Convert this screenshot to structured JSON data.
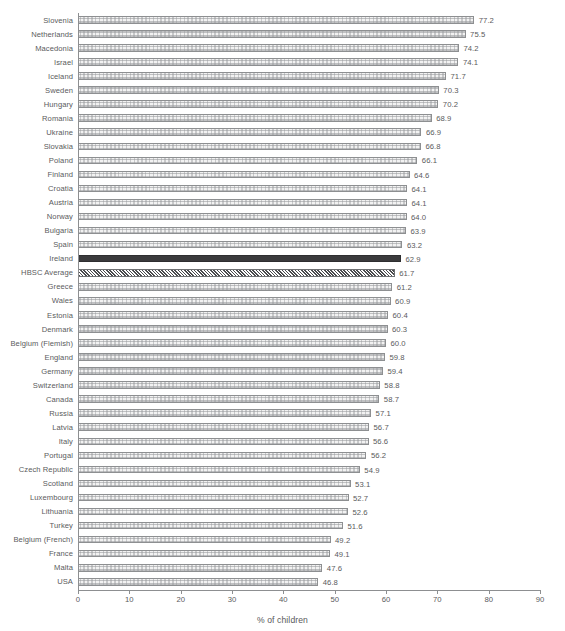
{
  "chart_data": {
    "type": "bar",
    "orientation": "horizontal",
    "title": "",
    "subtitle": "",
    "xlabel": "% of children",
    "ylabel": "",
    "xlim": [
      0,
      90
    ],
    "xticks": [
      0,
      10,
      20,
      30,
      40,
      50,
      60,
      70,
      80,
      90
    ],
    "grid": false,
    "legend": "none",
    "highlight_category": "Ireland",
    "average_category": "HBSC Average",
    "categories": [
      "Slovenia",
      "Netherlands",
      "Macedonia",
      "Israel",
      "Iceland",
      "Sweden",
      "Hungary",
      "Romania",
      "Ukraine",
      "Slovakia",
      "Poland",
      "Finland",
      "Croatia",
      "Austria",
      "Norway",
      "Bulgaria",
      "Spain",
      "Ireland",
      "HBSC Average",
      "Greece",
      "Wales",
      "Estonia",
      "Denmark",
      "Belgium (Flemish)",
      "England",
      "Germany",
      "Switzerland",
      "Canada",
      "Russia",
      "Latvia",
      "Italy",
      "Portugal",
      "Czech Republic",
      "Scotland",
      "Luxembourg",
      "Lithuania",
      "Turkey",
      "Belgium (French)",
      "France",
      "Malta",
      "USA"
    ],
    "values": [
      77.2,
      75.5,
      74.2,
      74.1,
      71.7,
      70.3,
      70.2,
      68.9,
      66.9,
      66.8,
      66.1,
      64.6,
      64.1,
      64.1,
      64.0,
      63.9,
      63.2,
      62.9,
      61.7,
      61.2,
      60.9,
      60.4,
      60.3,
      60.0,
      59.8,
      59.4,
      58.8,
      58.7,
      57.1,
      56.7,
      56.6,
      56.2,
      54.9,
      53.1,
      52.7,
      52.6,
      51.6,
      49.2,
      49.1,
      47.6,
      46.8
    ],
    "value_labels": [
      "77.2",
      "75.5",
      "74.2",
      "74.1",
      "71.7",
      "70.3",
      "70.2",
      "68.9",
      "66.9",
      "66.8",
      "66.1",
      "64.6",
      "64.1",
      "64.1",
      "64.0",
      "63.9",
      "63.2",
      "62.9",
      "61.7",
      "61.2",
      "60.9",
      "60.4",
      "60.3",
      "60.0",
      "59.8",
      "59.4",
      "58.8",
      "58.7",
      "57.1",
      "56.7",
      "56.6",
      "56.2",
      "54.9",
      "53.1",
      "52.7",
      "52.6",
      "51.6",
      "49.2",
      "49.1",
      "47.6",
      "46.8"
    ],
    "tick_labels": [
      "0",
      "10",
      "20",
      "30",
      "40",
      "50",
      "60",
      "70",
      "80",
      "90"
    ],
    "colors": {
      "bar_fill": "#f2f2f2",
      "bar_border": "#8d8f91",
      "highlight_fill": "#3a3a3c",
      "average_hatch": "#4a4b4d",
      "text": "#58595b",
      "axis": "#8d8f91",
      "background": "#ffffff"
    }
  }
}
